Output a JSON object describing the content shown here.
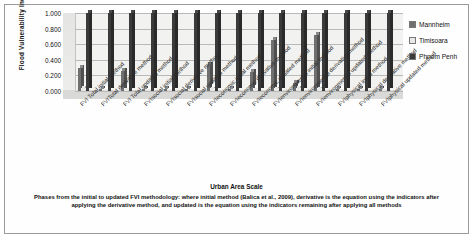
{
  "chart_data": {
    "type": "bar",
    "title": "",
    "xlabel": "Urban Area Scale",
    "ylabel": "Flood Vulnerability Index Value",
    "ylim": [
      0.0,
      1.0
    ],
    "yticks": [
      "0.000",
      "0.200",
      "0.400",
      "0.600",
      "0.800",
      "1.000"
    ],
    "grid": true,
    "legend_position": "right",
    "categories": [
      "FVI Total initial method",
      "FVITotal derivative method",
      "FVI Total updated method",
      "FVIsocial initial method",
      "FVIsocial derivative method",
      "FVIsocial updated method",
      "FVIeconomic initial method",
      "FVIeconomic derivative method",
      "FVIeconomic updated method",
      "FVIenvironmental initial method",
      "FVIenvironmental derivative method",
      "FVIenvironmental updated method",
      "FVIphysical initial method",
      "FVIphysical derivative method",
      "FVIphysical updated method"
    ],
    "series": [
      {
        "name": "Mannheim",
        "color": "#6f6f6f",
        "values": [
          0.3,
          0.03,
          0.26,
          0.02,
          0.02,
          0.02,
          0.33,
          0.03,
          0.25,
          0.65,
          0.1,
          0.72,
          0.03,
          0.03,
          0.03
        ]
      },
      {
        "name": "Timisoara",
        "color": "#e8e8e6",
        "values": [
          0.06,
          0.03,
          0.04,
          0.03,
          0.03,
          0.03,
          0.05,
          0.03,
          0.04,
          0.05,
          0.06,
          0.05,
          0.03,
          0.03,
          0.03
        ]
      },
      {
        "name": "Phnom Penh",
        "color": "#3a3a3a",
        "values": [
          1.0,
          1.0,
          1.0,
          1.0,
          1.0,
          1.0,
          1.0,
          1.0,
          1.0,
          1.0,
          1.0,
          1.0,
          1.0,
          1.0,
          1.0
        ]
      }
    ]
  },
  "caption": {
    "xaxis_title": "Urban Area Scale",
    "note": "Phases from the initial to updated  FVI methodology:  where initial method (Balica et al., 2009),  derivative  is the equation using  the indicators  after  applying  the derivative  method,  and  updated  is the equation  using  the indicators  remaining  after applying  all methods"
  },
  "legend": {
    "items": [
      {
        "label": "Mannheim",
        "color": "#6f6f6f"
      },
      {
        "label": "Timisoara",
        "color": "#e8e8e6"
      },
      {
        "label": "Phnom Penh",
        "color": "#3a3a3a"
      }
    ]
  }
}
